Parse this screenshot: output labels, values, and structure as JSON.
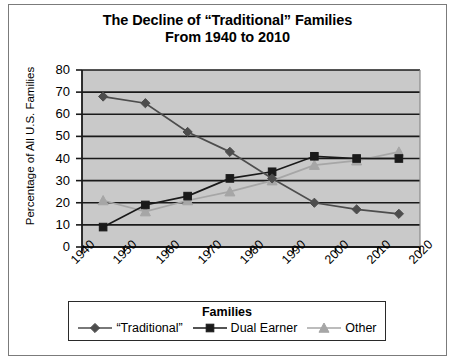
{
  "title": {
    "line1": "The Decline of “Traditional” Families",
    "line2": "From 1940 to 2010"
  },
  "axes": {
    "ylabel": "Percentage of All U.S. Families",
    "xlabel": "",
    "yticks": [
      "0",
      "10",
      "20",
      "30",
      "40",
      "50",
      "60",
      "70",
      "80"
    ],
    "xticks": [
      "1940",
      "1950",
      "1960",
      "1970",
      "1980",
      "1990",
      "2000",
      "2010",
      "2020"
    ]
  },
  "legend": {
    "title": "Families",
    "entries": [
      {
        "label": "“Traditional”",
        "marker": "diamond",
        "color": "#4d4d4d"
      },
      {
        "label": "Dual Earner",
        "marker": "square",
        "color": "#1a1a1a"
      },
      {
        "label": "Other",
        "marker": "triangle",
        "color": "#a6a6a6"
      }
    ]
  },
  "colors": {
    "plot_background": "#c9c9c9",
    "gridline": "#1a1a1a",
    "frame": "#7b7b7b",
    "traditional": "#4d4d4d",
    "dual_earner": "#1a1a1a",
    "other": "#a6a6a6"
  },
  "chart_data": {
    "type": "line",
    "title": "The Decline of “Traditional” Families From 1940 to 2010",
    "xlabel": "",
    "ylabel": "Percentage of All U.S. Families",
    "xlim": [
      1940,
      2020
    ],
    "ylim": [
      0,
      80
    ],
    "xticks": [
      1940,
      1950,
      1960,
      1970,
      1980,
      1990,
      2000,
      2010,
      2020
    ],
    "yticks": [
      0,
      10,
      20,
      30,
      40,
      50,
      60,
      70,
      80
    ],
    "grid": "horizontal",
    "legend_position": "below",
    "x": [
      1945,
      1955,
      1965,
      1975,
      1985,
      1995,
      2005,
      2015
    ],
    "series": [
      {
        "name": "“Traditional”",
        "marker": "diamond",
        "color": "#4d4d4d",
        "values": [
          68,
          65,
          52,
          43,
          31,
          20,
          17,
          15
        ]
      },
      {
        "name": "Dual Earner",
        "marker": "square",
        "color": "#1a1a1a",
        "values": [
          9,
          19,
          23,
          31,
          34,
          41,
          40,
          40
        ]
      },
      {
        "name": "Other",
        "marker": "triangle",
        "color": "#a6a6a6",
        "values": [
          21,
          16,
          21,
          25,
          30,
          37,
          39,
          43
        ]
      }
    ]
  }
}
